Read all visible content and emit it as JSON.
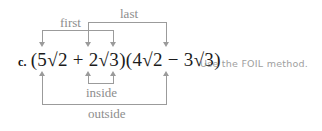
{
  "problem": {
    "label": "c.",
    "expression": "(5√2 + 2√3)(4√2 − 3√3)",
    "note": "Use the FOIL method."
  },
  "foil_labels": {
    "first": "first",
    "outer": "outside",
    "inner": "inside",
    "last": "last"
  },
  "colors": {
    "text": "#1b1b1b",
    "bracket": "#9b9b9b",
    "label": "#8d8d8d",
    "note": "#a0a0a0",
    "background": "#ffffff"
  },
  "diagram": {
    "term_anchors_px": [
      42,
      88,
      113,
      166
    ],
    "brackets": [
      {
        "name": "first",
        "from_px": 42,
        "to_px": 88,
        "rail_y_px": 30,
        "side": "top"
      },
      {
        "name": "last",
        "from_px": 88,
        "to_px": 166,
        "rail_y_px": 22,
        "side": "top"
      },
      {
        "name": "inside",
        "from_px": 88,
        "to_px": 113,
        "rail_y_px": 83,
        "side": "bottom"
      },
      {
        "name": "outside",
        "from_px": 42,
        "to_px": 166,
        "rail_y_px": 104,
        "side": "bottom"
      }
    ]
  }
}
